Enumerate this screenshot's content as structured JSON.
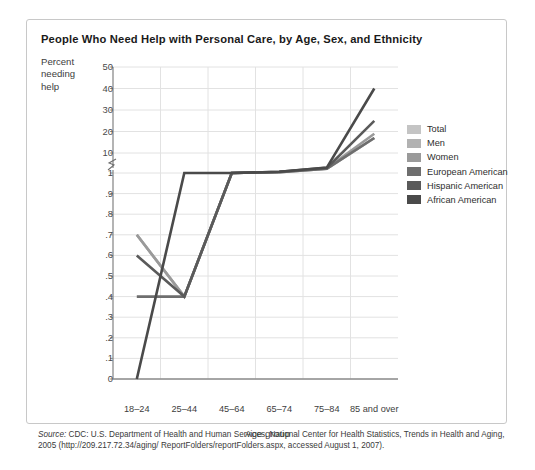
{
  "card": {
    "title": "People Who Need Help with Personal Care, by Age, Sex, and Ethnicity"
  },
  "axis": {
    "ylabel_line1": "Percent",
    "ylabel_line2": "needing",
    "ylabel_line3": "help",
    "xlabel": "Age group"
  },
  "source": {
    "prefix": "Source:",
    "text": " CDC: U.S. Department of Health and Human Services, National Center for Health Statistics, Trends in Health and Aging, 2005 (http://209.217.72.34/aging/ ReportFolders/reportFolders.aspx, accessed August 1, 2007)."
  },
  "chart_data": {
    "type": "line",
    "title": "People Who Need Help with Personal Care, by Age, Sex, and Ethnicity",
    "xlabel": "Age group",
    "ylabel": "Percent needing help",
    "categories": [
      "18–24",
      "25–44",
      "45–64",
      "65–74",
      "75–84",
      "85 and over"
    ],
    "y_ticks_upper": [
      "50",
      "40",
      "30",
      "20",
      "10"
    ],
    "y_ticks_lower": [
      "1",
      ".9",
      ".8",
      ".7",
      ".6",
      ".5",
      ".4",
      ".3",
      ".2",
      ".1",
      "0"
    ],
    "axis_break": true,
    "grid": true,
    "legend_position": "right",
    "series": [
      {
        "name": "Total",
        "color": "#c4c4c4",
        "values": [
          0.7,
          0.4,
          1.0,
          2.2,
          6.5,
          17.0
        ]
      },
      {
        "name": "Men",
        "color": "#b2b2b2",
        "values": [
          0.7,
          0.4,
          1.0,
          2.2,
          6.5,
          17.0
        ]
      },
      {
        "name": "Women",
        "color": "#9a9a9a",
        "values": [
          0.7,
          0.4,
          1.0,
          2.3,
          7.0,
          19.0
        ]
      },
      {
        "name": "European American",
        "color": "#6e6e6e",
        "values": [
          0.4,
          0.4,
          1.0,
          2.2,
          6.5,
          17.0
        ]
      },
      {
        "name": "Hispanic American",
        "color": "#5a5a5a",
        "values": [
          0.6,
          0.4,
          1.0,
          2.5,
          7.5,
          25.0
        ]
      },
      {
        "name": "African American",
        "color": "#4a4a4a",
        "values": [
          0.0,
          1.0,
          1.0,
          2.6,
          8.0,
          40.0
        ]
      }
    ]
  }
}
